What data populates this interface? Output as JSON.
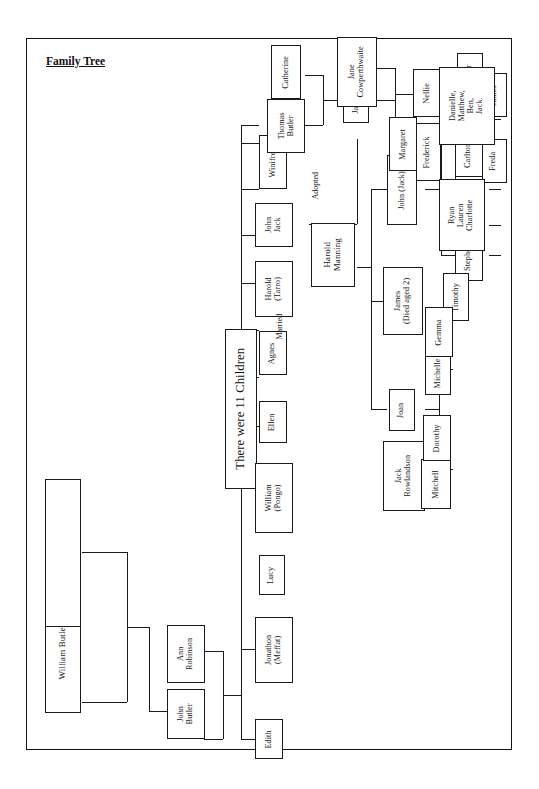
{
  "document": {
    "title": "Family Tree",
    "page_background": "#ffffff",
    "ink_color": "#1a1a1a"
  },
  "title": {
    "text": "Family Tree",
    "underlined": true
  },
  "annotations": [
    {
      "id": "adopted",
      "text": "Adopted"
    },
    {
      "id": "married",
      "text": "Married"
    }
  ],
  "center_box": {
    "text": "There were 11 Children"
  },
  "generation_1": {
    "label": "Great grandparents",
    "people": [
      {
        "id": "william_butler",
        "text": "William Butler  b.1823"
      },
      {
        "id": "elizabeth_benson",
        "text": "Elizabeth Benson b 1824"
      }
    ]
  },
  "generation_2": {
    "people": [
      {
        "id": "john_butler",
        "text": "John\nButler"
      },
      {
        "id": "ann_robinson",
        "text": "Ann\nRobinson"
      }
    ]
  },
  "children_of_11": [
    {
      "id": "edith",
      "text": "Edith"
    },
    {
      "id": "jonathon",
      "text": "Jonathon\n(Meffat)"
    },
    {
      "id": "lucy",
      "text": "Lucy"
    },
    {
      "id": "william_pongo",
      "text": "William\n(Pongo)"
    },
    {
      "id": "ellen",
      "text": "Ellen"
    },
    {
      "id": "agnes",
      "text": "Agnes"
    },
    {
      "id": "harold_tarro",
      "text": "Harold\n(Tarro)"
    },
    {
      "id": "john_jack",
      "text": "John\nJack"
    },
    {
      "id": "winifred",
      "text": "Winifred"
    },
    {
      "id": "thomas_butler",
      "text": "Thomas\nButler"
    },
    {
      "id": "catherine",
      "text": "Catherine"
    }
  ],
  "branch_thomas": {
    "spouse_pair": [
      {
        "id": "thomas_butler2",
        "text": "Thomas\nButler"
      },
      {
        "id": "catherine2",
        "text": "Catherine"
      }
    ],
    "children": [
      {
        "id": "james_b",
        "text": "James"
      }
    ],
    "james_spouse": {
      "id": "jane_cowperthwaite",
      "text": "Jane\nCowperthwaite"
    },
    "james_children": [
      {
        "id": "nellie",
        "text": "Nellie"
      },
      {
        "id": "frederick",
        "text": "Frederick"
      }
    ],
    "frederick_children": [
      {
        "id": "james_c",
        "text": "James"
      },
      {
        "id": "freda",
        "text": "Freda"
      }
    ]
  },
  "branch_harold": {
    "person": {
      "id": "harold_manning",
      "text": "Harold\nManning"
    },
    "married_to": "Ellen",
    "adopted_note": "Adopted",
    "children": [
      {
        "id": "john_jack2",
        "text": "John (Jack)"
      },
      {
        "id": "james_died",
        "text": "James\n(Died aged 2)"
      },
      {
        "id": "joan",
        "text": "Joan"
      }
    ],
    "john_jack_spouse": {
      "id": "margaret",
      "text": "Margaret"
    },
    "john_jack_children": [
      {
        "id": "lynn",
        "text": "Lynn"
      },
      {
        "id": "wendy",
        "text": "Wendy"
      },
      {
        "id": "stephen",
        "text": "Stephen"
      }
    ],
    "lynn_spouse": {
      "id": "peter",
      "text": "Peter"
    },
    "lynn_children": [
      {
        "id": "danielle_group",
        "text": "Danielle,\nMatthew,\nBen,\nJack."
      }
    ],
    "wendy_spouse": {
      "id": "carlton",
      "text": "Carlton"
    },
    "wendy_children": [
      {
        "id": "ryan_group",
        "text": "Ryan\nLauren\nCharlotte"
      }
    ],
    "stephen_spouse": {
      "id": "helen",
      "text": "Helen"
    },
    "stephen_children": [
      {
        "id": "timothy",
        "text": "Timothy"
      }
    ],
    "joan_spouse": {
      "id": "jack_rowlandson",
      "text": "Jack\nRowlandson"
    },
    "joan_children": [
      {
        "id": "tony",
        "text": "Tony"
      },
      {
        "id": "mitchell",
        "text": "Mitchell"
      }
    ],
    "tony_spouse": {
      "id": "michelle",
      "text": "Michelle"
    },
    "tony_children": [
      {
        "id": "gemma",
        "text": "Gemma"
      },
      {
        "id": "dean",
        "text": "Dean"
      },
      {
        "id": "lee",
        "text": "Lee"
      }
    ],
    "dean_spouse": {
      "id": "ella",
      "text": "Ella"
    },
    "dean_children": [
      {
        "id": "samuel",
        "text": "Samuel"
      }
    ],
    "lee_spouse": {
      "id": "julie",
      "text": "Julie"
    },
    "lee_children": [
      {
        "id": "jake",
        "text": "Jake"
      },
      {
        "id": "holly",
        "text": "Holly"
      }
    ],
    "mitchell_spouse": {
      "id": "dorothy",
      "text": "Dorothy"
    },
    "mitchell_children": [
      {
        "id": "mandy",
        "text": "Mandy"
      },
      {
        "id": "james_d",
        "text": "James"
      },
      {
        "id": "trevor",
        "text": "Trevor"
      },
      {
        "id": "neal",
        "text": "Neal"
      }
    ],
    "trevor_spouse": {
      "id": "megan",
      "text": "Megan"
    },
    "trevor_children": [
      {
        "id": "evie",
        "text": "Evie"
      }
    ]
  }
}
